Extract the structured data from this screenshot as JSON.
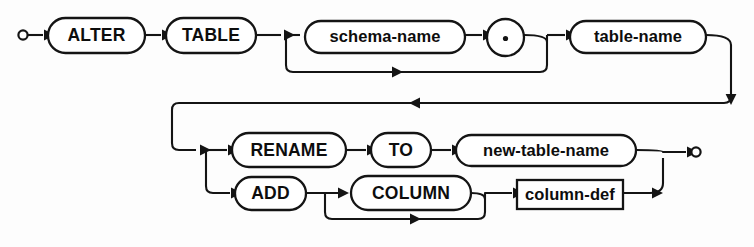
{
  "diagram": {
    "type": "railroad-syntax-diagram",
    "canvas": {
      "width": 754,
      "height": 247
    },
    "colors": {
      "background": "#fdfdfd",
      "stroke": "#141414",
      "node_fill": "#ffffff",
      "text": "#0d0d0d"
    },
    "endpoints": {
      "start": {
        "name": "start-terminal",
        "cx": 23,
        "cy": 35,
        "r": 4.6
      },
      "end": {
        "name": "end-terminal",
        "cx": 696,
        "cy": 152,
        "r": 4.6
      }
    },
    "nodes": [
      {
        "id": "alter",
        "label": "ALTER",
        "shape": "capsule",
        "kind": "keyword",
        "x": 48,
        "y": 18,
        "w": 97,
        "h": 35
      },
      {
        "id": "table",
        "label": "TABLE",
        "shape": "capsule",
        "kind": "keyword",
        "x": 166,
        "y": 18,
        "w": 90,
        "h": 35
      },
      {
        "id": "schema-name",
        "label": "schema-name",
        "shape": "capsule",
        "kind": "nonterminal",
        "x": 305,
        "y": 21,
        "w": 160,
        "h": 32
      },
      {
        "id": "dot",
        "label": ".",
        "shape": "circle",
        "kind": "keyword",
        "x": 487,
        "y": 19,
        "w": 37,
        "h": 37
      },
      {
        "id": "table-name",
        "label": "table-name",
        "shape": "capsule",
        "kind": "nonterminal",
        "x": 570,
        "y": 21,
        "w": 136,
        "h": 32
      },
      {
        "id": "rename",
        "label": "RENAME",
        "shape": "capsule",
        "kind": "keyword",
        "x": 232,
        "y": 133,
        "w": 114,
        "h": 34
      },
      {
        "id": "to",
        "label": "TO",
        "shape": "capsule",
        "kind": "keyword",
        "x": 371,
        "y": 133,
        "w": 60,
        "h": 34
      },
      {
        "id": "new-table-name",
        "label": "new-table-name",
        "shape": "capsule",
        "kind": "nonterminal",
        "x": 456,
        "y": 135,
        "w": 180,
        "h": 31
      },
      {
        "id": "add",
        "label": "ADD",
        "shape": "capsule",
        "kind": "keyword",
        "x": 235,
        "y": 177,
        "w": 71,
        "h": 33
      },
      {
        "id": "column",
        "label": "COLUMN",
        "shape": "capsule",
        "kind": "keyword",
        "x": 351,
        "y": 176,
        "w": 120,
        "h": 34
      },
      {
        "id": "column-def",
        "label": "column-def",
        "shape": "rect",
        "kind": "nonterminal",
        "x": 517,
        "y": 180,
        "w": 106,
        "h": 29
      }
    ],
    "paths": [
      {
        "id": "start-to-alter",
        "d": "M 28 35 L 43 35"
      },
      {
        "id": "alter-to-table",
        "d": "M 145 35 L 161 35"
      },
      {
        "id": "table-to-split",
        "d": "M 256 35 L 281 35"
      },
      {
        "id": "split-to-schema",
        "d": "M 286 35 L 300 35"
      },
      {
        "id": "schema-bypass",
        "d": "M 286 35 L 286 65 Q 286 72 293 72 L 540 72 Q 547 72 547 65 L 547 42"
      },
      {
        "id": "schema-to-dot",
        "d": "M 465 35 L 482 35"
      },
      {
        "id": "dot-to-merge",
        "d": "M 524 35 Q 547 35 547 42 L 547 35"
      },
      {
        "id": "merge-to-tablename",
        "d": "M 547 35 L 565 35"
      },
      {
        "id": "tablename-out",
        "d": "M 706 35 Q 731 35 731 45 L 731 96"
      },
      {
        "id": "return-line",
        "d": "M 731 96 Q 731 103 724 103 L 179 103 Q 172 103 172 110 L 172 143 Q 172 150 179 150 L 196 150"
      },
      {
        "id": "branch-to-rename",
        "d": "M 206 150 L 227 150"
      },
      {
        "id": "branch-to-add",
        "d": "M 206 150 L 206 186 Q 206 193 213 193 L 230 193"
      },
      {
        "id": "rename-to-to",
        "d": "M 346 150 L 366 150"
      },
      {
        "id": "to-to-newname",
        "d": "M 431 150 L 451 150"
      },
      {
        "id": "newname-to-end",
        "d": "M 636 150 Q 663 150 663 152 L 663 152 L 686 152"
      },
      {
        "id": "add-to-colsplit",
        "d": "M 306 193 L 341 193"
      },
      {
        "id": "column-bypass",
        "d": "M 325 193 L 325 212 Q 325 219 332 219 L 478 219 Q 485 219 485 212 L 485 199"
      },
      {
        "id": "column-to-coldef",
        "d": "M 471 193 Q 485 193 485 199 L 485 193 L 512 193"
      },
      {
        "id": "coldef-to-up",
        "d": "M 623 193 L 650 193 Q 663 193 663 183 L 663 158"
      }
    ],
    "arrows": [
      {
        "id": "arrow-into-alter",
        "x": 44,
        "y": 35,
        "dir": "right"
      },
      {
        "id": "arrow-into-table",
        "x": 162,
        "y": 35,
        "dir": "right"
      },
      {
        "id": "arrow-into-split",
        "x": 284,
        "y": 35,
        "dir": "right"
      },
      {
        "id": "arrow-into-dot",
        "x": 483,
        "y": 35,
        "dir": "right"
      },
      {
        "id": "arrow-schema-bypass",
        "x": 392,
        "y": 72,
        "dir": "right"
      },
      {
        "id": "arrow-into-tablename",
        "x": 566,
        "y": 35,
        "dir": "right"
      },
      {
        "id": "arrow-down-right",
        "x": 731,
        "y": 94,
        "dir": "down"
      },
      {
        "id": "arrow-return",
        "x": 420,
        "y": 103,
        "dir": "left"
      },
      {
        "id": "arrow-into-branch",
        "x": 200,
        "y": 150,
        "dir": "right"
      },
      {
        "id": "arrow-into-rename",
        "x": 228,
        "y": 150,
        "dir": "right"
      },
      {
        "id": "arrow-into-add",
        "x": 231,
        "y": 193,
        "dir": "right"
      },
      {
        "id": "arrow-into-to",
        "x": 367,
        "y": 150,
        "dir": "right"
      },
      {
        "id": "arrow-into-newname",
        "x": 452,
        "y": 150,
        "dir": "right"
      },
      {
        "id": "arrow-into-end",
        "x": 687,
        "y": 152,
        "dir": "right"
      },
      {
        "id": "arrow-into-colsplit",
        "x": 338,
        "y": 193,
        "dir": "right"
      },
      {
        "id": "arrow-column-bypass",
        "x": 410,
        "y": 219,
        "dir": "right"
      },
      {
        "id": "arrow-into-coldef",
        "x": 513,
        "y": 193,
        "dir": "right"
      },
      {
        "id": "arrow-coldef-out",
        "x": 652,
        "y": 193,
        "dir": "right"
      }
    ]
  }
}
